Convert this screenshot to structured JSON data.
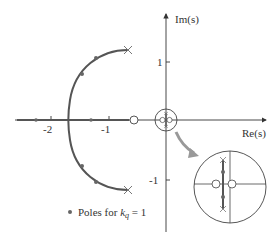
{
  "diagram": {
    "type": "root-locus",
    "axes": {
      "x_label": "Re(s)",
      "y_label": "Im(s)",
      "x_ticks": [
        "-2",
        "-1"
      ],
      "y_ticks": [
        "1",
        "-1"
      ]
    },
    "legend": {
      "marker": "dot",
      "text_prefix": "Poles for ",
      "k_symbol": "k",
      "k_subscript": "q",
      "text_suffix": " = 1"
    },
    "open_loop_poles": [
      {
        "re": -0.65,
        "im": 1.2
      },
      {
        "re": -0.65,
        "im": -1.2
      },
      {
        "re": 0.0,
        "im": 0.05
      },
      {
        "re": 0.0,
        "im": -0.05
      }
    ],
    "zeros": [
      {
        "re": -0.55,
        "im": 0.0
      },
      {
        "re": -0.02,
        "im": 0.0
      },
      {
        "re": 0.02,
        "im": 0.0
      }
    ],
    "closed_loop_poles_kq_1": [
      {
        "re": -2.3,
        "im": 0.0
      },
      {
        "re": -1.3,
        "im": 0.0
      },
      {
        "re": -1.25,
        "im": 1.1
      },
      {
        "re": -1.5,
        "im": 0.8
      },
      {
        "re": -1.5,
        "im": -0.8
      },
      {
        "re": -1.25,
        "im": -1.1
      }
    ],
    "breakin_point": {
      "re": -1.7,
      "im": 0.0
    },
    "inset": {
      "description": "Magnified view of region near origin"
    },
    "colors": {
      "locus": "#555555",
      "axis": "#333333",
      "pole_marker": "#777777",
      "zero_marker": "#444444",
      "arrow": "#999999"
    }
  }
}
